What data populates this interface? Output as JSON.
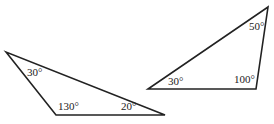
{
  "diagram": {
    "stroke_color": "#222222",
    "background": "#ffffff",
    "triangles": [
      {
        "name": "left-triangle",
        "points": "6,52 56,115 165,115",
        "angles": [
          {
            "label": "30°",
            "x": 27,
            "y": 76
          },
          {
            "label": "130°",
            "x": 58,
            "y": 110
          },
          {
            "label": "20°",
            "x": 121,
            "y": 110
          }
        ]
      },
      {
        "name": "right-triangle",
        "points": "148,89 256,89 268,7",
        "angles": [
          {
            "label": "30°",
            "x": 168,
            "y": 85
          },
          {
            "label": "100°",
            "x": 234,
            "y": 83
          },
          {
            "label": "50°",
            "x": 249,
            "y": 30
          }
        ]
      }
    ]
  }
}
